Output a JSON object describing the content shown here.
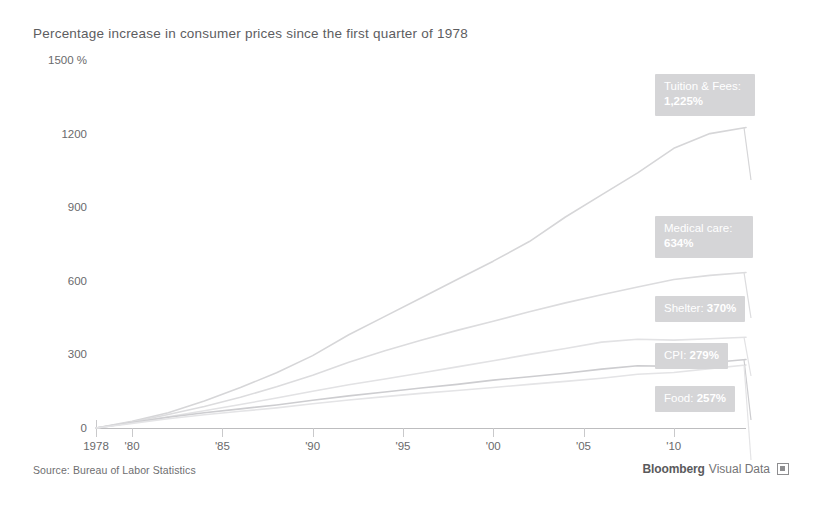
{
  "chart_data": {
    "type": "line",
    "title": "Percentage increase in consumer prices since the first quarter of 1978",
    "xlabel": "",
    "ylabel": "",
    "ylim": [
      0,
      1500
    ],
    "xlim": [
      1978,
      2014
    ],
    "y_unit": "%",
    "grid": false,
    "legend_position": "right-inline-callouts",
    "y_ticks": [
      {
        "value": 1500,
        "label": "1500 %"
      },
      {
        "value": 1200,
        "label": "1200"
      },
      {
        "value": 900,
        "label": "900"
      },
      {
        "value": 600,
        "label": "600"
      },
      {
        "value": 300,
        "label": "300"
      },
      {
        "value": 0,
        "label": "0"
      }
    ],
    "x_ticks": [
      {
        "value": 1978,
        "label": "1978"
      },
      {
        "value": 1980,
        "label": "'80"
      },
      {
        "value": 1985,
        "label": "'85"
      },
      {
        "value": 1990,
        "label": "'90"
      },
      {
        "value": 1995,
        "label": "'95"
      },
      {
        "value": 2000,
        "label": "'00"
      },
      {
        "value": 2005,
        "label": "'05"
      },
      {
        "value": 2010,
        "label": "'10"
      }
    ],
    "x": [
      1978,
      1980,
      1982,
      1984,
      1986,
      1988,
      1990,
      1992,
      1994,
      1996,
      1998,
      2000,
      2002,
      2004,
      2006,
      2008,
      2010,
      2012,
      2014
    ],
    "series": [
      {
        "name": "Tuition & Fees",
        "end_value": 1225,
        "end_label": "1,225%",
        "color": "#d6d6d8",
        "values": [
          0,
          27,
          62,
          110,
          165,
          225,
          295,
          380,
          455,
          530,
          605,
          680,
          760,
          860,
          950,
          1040,
          1140,
          1200,
          1225
        ]
      },
      {
        "name": "Medical care",
        "end_value": 634,
        "end_label": "634%",
        "color": "#dcdcde",
        "values": [
          0,
          24,
          55,
          88,
          125,
          168,
          215,
          268,
          315,
          358,
          398,
          435,
          474,
          510,
          543,
          575,
          605,
          622,
          634
        ]
      },
      {
        "name": "Shelter",
        "end_value": 370,
        "end_label": "370%",
        "color": "#e2e2e4",
        "values": [
          0,
          22,
          46,
          70,
          96,
          122,
          150,
          176,
          200,
          224,
          249,
          274,
          300,
          324,
          350,
          362,
          358,
          364,
          370
        ]
      },
      {
        "name": "CPI",
        "end_value": 279,
        "end_label": "279%",
        "color": "#cdcdd0",
        "values": [
          0,
          22,
          44,
          62,
          78,
          94,
          113,
          131,
          147,
          163,
          178,
          195,
          209,
          223,
          240,
          254,
          251,
          266,
          279
        ]
      },
      {
        "name": "Food",
        "end_value": 257,
        "end_label": "257%",
        "color": "#e4e4e6",
        "values": [
          0,
          19,
          38,
          54,
          68,
          82,
          99,
          114,
          128,
          141,
          153,
          165,
          178,
          190,
          203,
          219,
          226,
          242,
          257
        ]
      }
    ],
    "callouts": [
      {
        "id": "tuition",
        "name": "Tuition & Fees:",
        "value": "1,225%",
        "two_line": true
      },
      {
        "id": "medical",
        "name": "Medical care:",
        "value": "634%",
        "two_line": true
      },
      {
        "id": "shelter",
        "name": "Shelter:",
        "value": "370%",
        "two_line": false
      },
      {
        "id": "cpi",
        "name": "CPI:",
        "value": "279%",
        "two_line": false
      },
      {
        "id": "food",
        "name": "Food:",
        "value": "257%",
        "two_line": false
      }
    ]
  },
  "footer": {
    "source": "Source: Bureau of Labor Statistics",
    "brand_primary": "Bloomberg",
    "brand_secondary": "Visual Data"
  },
  "colors": {
    "text": "#58585a",
    "axis": "#bdbdbf",
    "callout_bg": "#d5d5d7",
    "callout_text": "#ffffff"
  }
}
